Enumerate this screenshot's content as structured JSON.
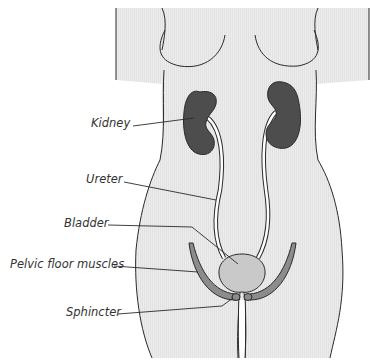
{
  "diagram": {
    "labels": {
      "kidney": "Kidney",
      "ureter": "Ureter",
      "bladder": "Bladder",
      "pelvic_floor": "Pelvic floor muscles",
      "sphincter": "Sphincter"
    },
    "colors": {
      "body_fill": "#ebebeb",
      "outline": "#2a2a2a",
      "kidney": "#4d4d4d",
      "bladder": "#c9c9c9",
      "muscle": "#8c8c8c",
      "ureter_fill": "#ffffff"
    }
  }
}
